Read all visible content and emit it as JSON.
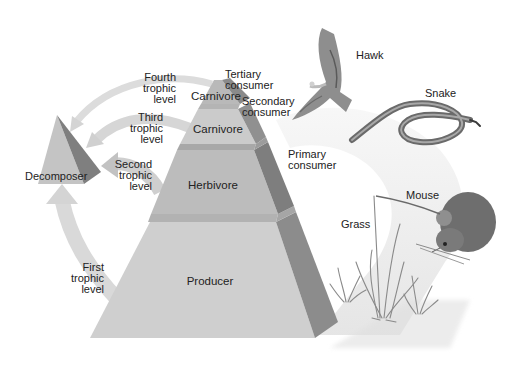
{
  "diagram": {
    "type": "trophic-level-pyramid",
    "colors": {
      "background": "#ffffff",
      "producer_face": "#cfcfcf",
      "herbivore_face": "#bdbdbd",
      "carnivore3_face": "#c8c8c8",
      "carnivore4_face": "#b8b8b8",
      "side_face_dark": "#8a8a8a",
      "side_face_mid": "#9a9a9a",
      "band_light": "#e6e6e6",
      "arrow": "#d9d9d9",
      "text": "#222222"
    },
    "pyramid_levels": [
      {
        "id": "producer",
        "label": "Producer",
        "trophic_level": "First\ntrophic\nlevel"
      },
      {
        "id": "herbivore",
        "label": "Herbivore",
        "trophic_level": "Second\ntrophic\nlevel"
      },
      {
        "id": "carnivore-3",
        "label": "Carnivore",
        "trophic_level": "Third\ntrophic\nlevel"
      },
      {
        "id": "carnivore-4",
        "label": "Carnivore",
        "trophic_level": "Fourth\ntrophic\nlevel"
      }
    ],
    "decomposer": {
      "label": "Decomposer"
    },
    "consumer_labels": [
      {
        "id": "tertiary",
        "label": "Tertiary\nconsumer"
      },
      {
        "id": "secondary",
        "label": "Secondary\nconsumer"
      },
      {
        "id": "primary",
        "label": "Primary\nconsumer"
      }
    ],
    "organisms": [
      {
        "id": "hawk",
        "label": "Hawk"
      },
      {
        "id": "snake",
        "label": "Snake"
      },
      {
        "id": "mouse",
        "label": "Mouse"
      },
      {
        "id": "grass",
        "label": "Grass"
      }
    ]
  }
}
